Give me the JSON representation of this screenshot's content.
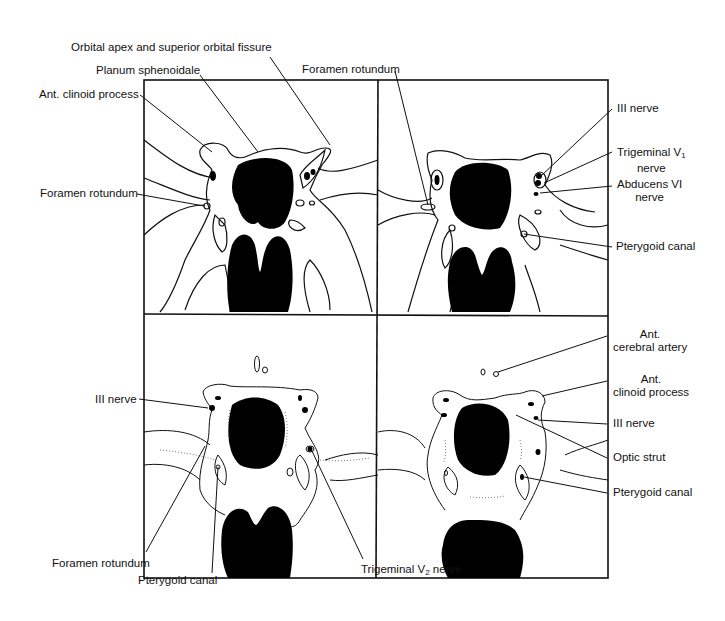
{
  "figure": {
    "panels": [
      "top-left",
      "top-right",
      "bottom-left",
      "bottom-right"
    ]
  },
  "labels": {
    "orbital_apex": "Orbital apex and superior orbital fissure",
    "planum": "Planum sphenoidale",
    "ant_clinoid_tl": "Ant. clinoid process",
    "foramen_rotundum_tl": "Foramen rotundum",
    "foramen_rotundum_top": "Foramen rotundum",
    "iii_nerve_tr": "III nerve",
    "trigeminal_v1_a": "Trigeminal V",
    "trigeminal_v1_sub": "1",
    "trigeminal_v1_b": "nerve",
    "abducens_a": "Abducens VI",
    "abducens_b": "nerve",
    "pterygoid_tr": "Pterygoid canal",
    "ant_cerebral_a": "Ant.",
    "ant_cerebral_b": "cerebral artery",
    "ant_clinoid_br_a": "Ant.",
    "ant_clinoid_br_b": "clinoid process",
    "iii_nerve_br": "III nerve",
    "optic_strut": "Optic strut",
    "pterygoid_br": "Pterygoid canal",
    "iii_nerve_bl": "III nerve",
    "foramen_rotundum_bl": "Foramen rotundum",
    "pterygoid_bl": "Pterygoid canal",
    "trigeminal_v2_a": "Trigeminal V",
    "trigeminal_v2_sub": "2",
    "trigeminal_v2_b": " nerve"
  }
}
